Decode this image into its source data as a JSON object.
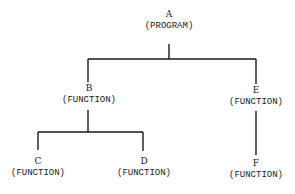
{
  "diagram": {
    "type": "hierarchy-tree",
    "line_color": "#1a1a1a",
    "nodes": [
      {
        "id": "A",
        "letter": "A",
        "kind": "(PROGRAM)"
      },
      {
        "id": "B",
        "letter": "B",
        "kind": "(FUNCTION)"
      },
      {
        "id": "E",
        "letter": "E",
        "kind": "(FUNCTION)"
      },
      {
        "id": "C",
        "letter": "C",
        "kind": "(FUNCTION)"
      },
      {
        "id": "D",
        "letter": "D",
        "kind": "(FUNCTION)"
      },
      {
        "id": "F",
        "letter": "F",
        "kind": "(FUNCTION)"
      }
    ],
    "edges": [
      {
        "from": "A",
        "to": "B"
      },
      {
        "from": "A",
        "to": "E"
      },
      {
        "from": "B",
        "to": "C"
      },
      {
        "from": "B",
        "to": "D"
      },
      {
        "from": "E",
        "to": "F"
      }
    ]
  }
}
